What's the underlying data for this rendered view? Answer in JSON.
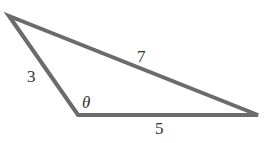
{
  "diagram": {
    "type": "triangle",
    "stroke_color": "#6b6b6b",
    "vertices": {
      "top_left": [
        9,
        16
      ],
      "bottom_left": [
        78,
        115
      ],
      "right": [
        258,
        115
      ]
    },
    "labels": {
      "side_long": "7",
      "side_left": "3",
      "side_bottom": "5",
      "angle": "θ"
    }
  }
}
